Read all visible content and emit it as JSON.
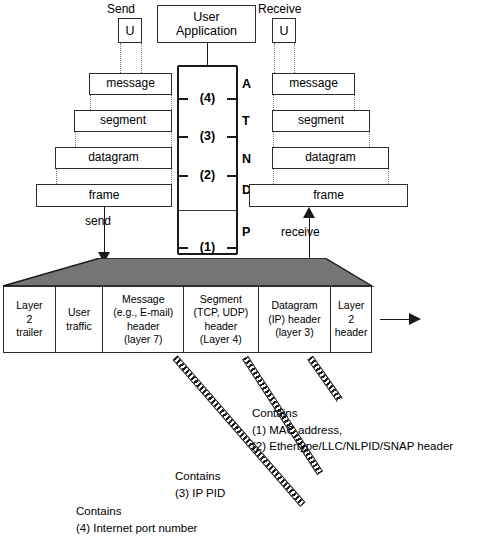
{
  "diagram": {
    "user_application": "User\nApplication",
    "send_label": "Send",
    "receive_label": "Receive",
    "send_unit": "U",
    "receive_unit": "U",
    "send_arrow_label": "send",
    "receive_arrow_label": "receive"
  },
  "send_stack": {
    "boxes": [
      {
        "label": "message"
      },
      {
        "label": "segment"
      },
      {
        "label": "datagram"
      },
      {
        "label": "frame"
      }
    ]
  },
  "receive_stack": {
    "boxes": [
      {
        "label": "message"
      },
      {
        "label": "segment"
      },
      {
        "label": "datagram"
      },
      {
        "label": "frame"
      }
    ]
  },
  "protocol_column": {
    "layer_numbers": [
      "(4)",
      "(3)",
      "(2)",
      "(1)"
    ],
    "osi_letters": [
      "A",
      "T",
      "N",
      "D",
      "P"
    ]
  },
  "pdu": {
    "fields": [
      {
        "lines": [
          "Layer",
          "2",
          "trailer"
        ]
      },
      {
        "lines": [
          "User",
          "traffic"
        ]
      },
      {
        "lines": [
          "Message",
          "(e.g., E-mail)",
          "header",
          "(layer 7)"
        ]
      },
      {
        "lines": [
          "Segment",
          "(TCP, UDP)",
          "header",
          "(Layer 4)"
        ]
      },
      {
        "lines": [
          "Datagram",
          "(IP) header",
          "(layer 3)"
        ]
      },
      {
        "lines": [
          "Layer",
          "2",
          "header"
        ]
      }
    ]
  },
  "annotations": [
    {
      "lines": [
        "Contains",
        "(1) MAC address,",
        "(2) Ethertype/LLC/NLPID/SNAP header"
      ]
    },
    {
      "lines": [
        "Contains",
        "(3) IP PID"
      ]
    },
    {
      "lines": [
        "Contains",
        "(4) Internet port number"
      ]
    }
  ],
  "colors": {
    "ink": "#1a1a1a",
    "trapezoid_fill": "#757575",
    "paper": "#ffffff"
  }
}
